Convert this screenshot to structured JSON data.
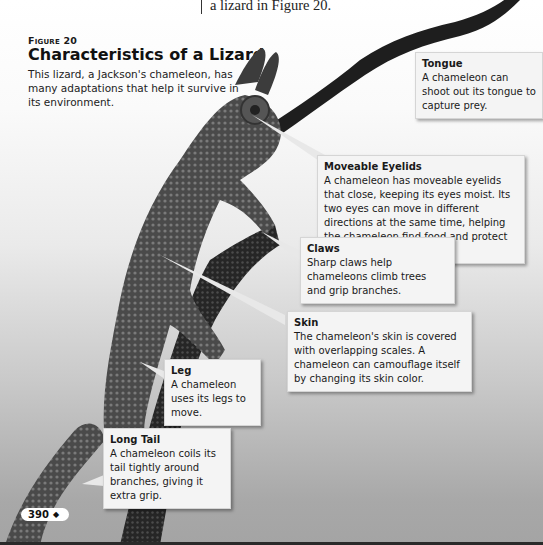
{
  "intro": {
    "text": "a lizard in Figure 20."
  },
  "figure": {
    "label": "Figure 20",
    "title": "Characteristics of a Lizard",
    "caption": "This lizard, a Jackson's chameleon, has many adaptations that help it survive in its environment."
  },
  "callouts": [
    {
      "id": "tongue",
      "title": "Tongue",
      "body": "A chameleon can shoot out its tongue to capture prey."
    },
    {
      "id": "eyelids",
      "title": "Moveable Eyelids",
      "body": "A chameleon has moveable eyelids that close, keeping its eyes moist. Its two eyes can move in different directions at the same time, helping the chameleon find food and protect itself."
    },
    {
      "id": "claws",
      "title": "Claws",
      "body": "Sharp claws help chameleons climb trees and grip branches."
    },
    {
      "id": "skin",
      "title": "Skin",
      "body": "The chameleon's skin is covered with overlapping scales. A chameleon can camouflage itself by changing its skin color."
    },
    {
      "id": "leg",
      "title": "Leg",
      "body": "A chameleon uses its legs to move."
    },
    {
      "id": "tail",
      "title": "Long Tail",
      "body": "A chameleon coils its tail tightly around branches, giving it extra grip."
    }
  ],
  "page": {
    "number": "390",
    "marker": "◆"
  }
}
